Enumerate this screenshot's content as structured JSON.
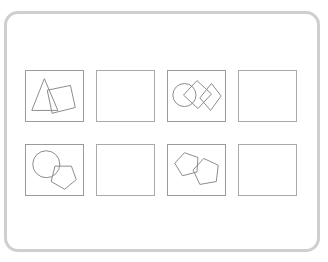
{
  "corner_label": {
    "text": "..."
  },
  "card": {
    "border_color": "#cfcfcf",
    "background_color": "#ffffff"
  },
  "grid": {
    "rows": 2,
    "columns": 4,
    "stroke_color": "#8d8d8d",
    "panel_border_color": "#9a9a9a",
    "panels": [
      {
        "id": "panel-1",
        "position": "row-1-col-1",
        "role": "stimulus",
        "empty": false,
        "shape_count": 2,
        "shapes": [
          "triangle",
          "rotated-square"
        ],
        "description": "triangle overlapping a tilted square"
      },
      {
        "id": "panel-2",
        "position": "row-1-col-2",
        "role": "answer-blank",
        "empty": true,
        "shape_count": 0,
        "shapes": [],
        "description": "empty answer panel"
      },
      {
        "id": "panel-3",
        "position": "row-1-col-3",
        "role": "stimulus",
        "empty": false,
        "shape_count": 3,
        "shapes": [
          "circle",
          "rotated-square",
          "rotated-square"
        ],
        "description": "circle overlapping two diamond-oriented squares"
      },
      {
        "id": "panel-4",
        "position": "row-1-col-4",
        "role": "answer-blank",
        "empty": true,
        "shape_count": 0,
        "shapes": [],
        "description": "empty answer panel"
      },
      {
        "id": "panel-5",
        "position": "row-2-col-1",
        "role": "stimulus",
        "empty": false,
        "shape_count": 2,
        "shapes": [
          "circle",
          "pentagon"
        ],
        "description": "circle overlapping a pentagon"
      },
      {
        "id": "panel-6",
        "position": "row-2-col-2",
        "role": "answer-blank",
        "empty": true,
        "shape_count": 0,
        "shapes": [],
        "description": "empty answer panel"
      },
      {
        "id": "panel-7",
        "position": "row-2-col-3",
        "role": "stimulus",
        "empty": false,
        "shape_count": 2,
        "shapes": [
          "pentagon",
          "pentagon"
        ],
        "description": "two overlapping pentagons"
      },
      {
        "id": "panel-8",
        "position": "row-2-col-4",
        "role": "answer-blank",
        "empty": true,
        "shape_count": 0,
        "shapes": [],
        "description": "empty answer panel"
      }
    ]
  }
}
